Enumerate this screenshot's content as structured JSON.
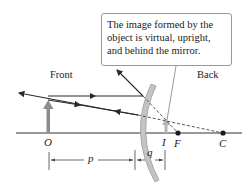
{
  "callout": {
    "lines": [
      "The image formed by the",
      "object is virtual, upright,",
      "and behind the mirror."
    ]
  },
  "labels": {
    "front": "Front",
    "back": "Back",
    "object": "O",
    "image": "I",
    "focal_point": "F",
    "center": "C",
    "object_distance": "p",
    "image_distance": "q"
  },
  "colors": {
    "axis": "#333333",
    "ray": "#2a2a2a",
    "object_arrow": "#8c8c8c",
    "image_arrow": "#b5b5b5",
    "mirror": "#c4c4c4",
    "mirror_edge": "#9a9a9a"
  }
}
